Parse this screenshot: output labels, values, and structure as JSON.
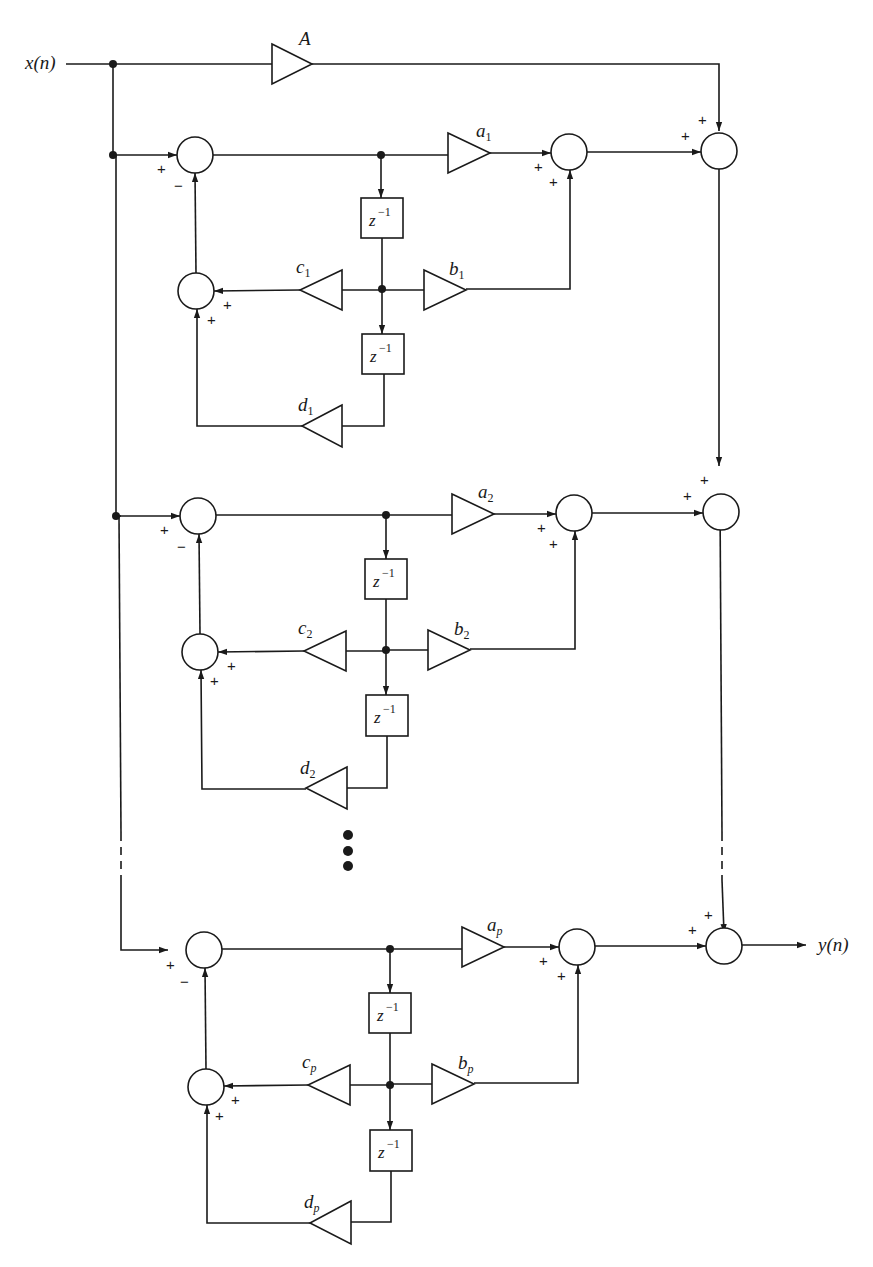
{
  "diagram": {
    "input_label": "x(n)",
    "output_label": "y(n)",
    "direct_gain": "A",
    "delay_label": "z",
    "delay_exp": "−1",
    "plus": "+",
    "minus": "−",
    "sections": [
      {
        "a": "a",
        "b": "b",
        "c": "c",
        "d": "d",
        "sub": "1"
      },
      {
        "a": "a",
        "b": "b",
        "c": "c",
        "d": "d",
        "sub": "2"
      },
      {
        "a": "a",
        "b": "b",
        "c": "c",
        "d": "d",
        "sub": "p"
      }
    ],
    "ellipsis": "⋮"
  }
}
